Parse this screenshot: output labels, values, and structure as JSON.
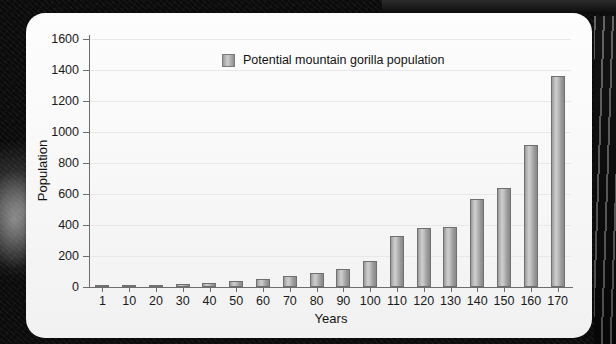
{
  "chart_data": {
    "type": "bar",
    "title": "",
    "xlabel": "Years",
    "ylabel": "Population",
    "ylim": [
      0,
      1600
    ],
    "yticks": [
      0,
      200,
      400,
      600,
      800,
      1000,
      1200,
      1400,
      1600
    ],
    "grid": true,
    "legend_position": "top-center",
    "legend": [
      "Potential mountain gorilla population"
    ],
    "categories": [
      "1",
      "10",
      "20",
      "30",
      "40",
      "50",
      "60",
      "70",
      "80",
      "90",
      "100",
      "110",
      "120",
      "130",
      "140",
      "150",
      "160",
      "170"
    ],
    "series": [
      {
        "name": "Potential mountain gorilla population",
        "values": [
          5,
          10,
          14,
          19,
          28,
          40,
          50,
          70,
          93,
          118,
          165,
          330,
          380,
          390,
          570,
          640,
          915,
          1360
        ],
        "color": "#b0b0b0"
      }
    ]
  },
  "colors": {
    "bar_fill": "#b0b0b0",
    "bar_stroke": "#6f6f6f",
    "axis": "#6d6d6d",
    "grid": "#e8e8e8",
    "card_background": "#fbfbfb",
    "backdrop": "#0b0b0b",
    "text": "#1a1a1a"
  }
}
